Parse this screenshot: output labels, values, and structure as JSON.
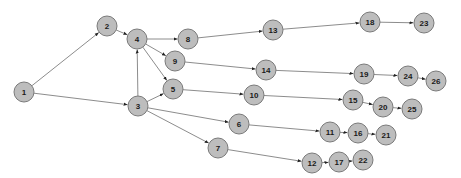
{
  "diagram": {
    "type": "directed-graph",
    "node_fill": "#bdbdbd",
    "node_stroke": "#7a7a7a",
    "edge_color": "#6f6f6f",
    "nodes": [
      {
        "id": "1",
        "label": "1",
        "x": 24,
        "y": 92
      },
      {
        "id": "2",
        "label": "2",
        "x": 107,
        "y": 26
      },
      {
        "id": "3",
        "label": "3",
        "x": 138,
        "y": 106
      },
      {
        "id": "4",
        "label": "4",
        "x": 137,
        "y": 39
      },
      {
        "id": "5",
        "label": "5",
        "x": 173,
        "y": 89
      },
      {
        "id": "6",
        "label": "6",
        "x": 239,
        "y": 124
      },
      {
        "id": "7",
        "label": "7",
        "x": 218,
        "y": 148
      },
      {
        "id": "8",
        "label": "8",
        "x": 188,
        "y": 39
      },
      {
        "id": "9",
        "label": "9",
        "x": 175,
        "y": 61
      },
      {
        "id": "10",
        "label": "10",
        "x": 254,
        "y": 95
      },
      {
        "id": "11",
        "label": "11",
        "x": 330,
        "y": 132
      },
      {
        "id": "12",
        "label": "12",
        "x": 312,
        "y": 163
      },
      {
        "id": "13",
        "label": "13",
        "x": 273,
        "y": 30
      },
      {
        "id": "14",
        "label": "14",
        "x": 266,
        "y": 70
      },
      {
        "id": "15",
        "label": "15",
        "x": 353,
        "y": 100
      },
      {
        "id": "16",
        "label": "16",
        "x": 358,
        "y": 133
      },
      {
        "id": "17",
        "label": "17",
        "x": 339,
        "y": 162
      },
      {
        "id": "18",
        "label": "18",
        "x": 370,
        "y": 22
      },
      {
        "id": "19",
        "label": "19",
        "x": 364,
        "y": 74
      },
      {
        "id": "20",
        "label": "20",
        "x": 383,
        "y": 107
      },
      {
        "id": "21",
        "label": "21",
        "x": 386,
        "y": 135
      },
      {
        "id": "22",
        "label": "22",
        "x": 363,
        "y": 160
      },
      {
        "id": "23",
        "label": "23",
        "x": 424,
        "y": 23
      },
      {
        "id": "24",
        "label": "24",
        "x": 408,
        "y": 76
      },
      {
        "id": "25",
        "label": "25",
        "x": 412,
        "y": 109
      },
      {
        "id": "26",
        "label": "26",
        "x": 436,
        "y": 81
      }
    ],
    "edges": [
      {
        "from": "1",
        "to": "2"
      },
      {
        "from": "1",
        "to": "3"
      },
      {
        "from": "2",
        "to": "4"
      },
      {
        "from": "3",
        "to": "4"
      },
      {
        "from": "4",
        "to": "8"
      },
      {
        "from": "4",
        "to": "9"
      },
      {
        "from": "4",
        "to": "5"
      },
      {
        "from": "3",
        "to": "5"
      },
      {
        "from": "3",
        "to": "6"
      },
      {
        "from": "3",
        "to": "7"
      },
      {
        "from": "8",
        "to": "13"
      },
      {
        "from": "9",
        "to": "14"
      },
      {
        "from": "5",
        "to": "10"
      },
      {
        "from": "6",
        "to": "11"
      },
      {
        "from": "7",
        "to": "12"
      },
      {
        "from": "13",
        "to": "18"
      },
      {
        "from": "14",
        "to": "19"
      },
      {
        "from": "10",
        "to": "15"
      },
      {
        "from": "11",
        "to": "16"
      },
      {
        "from": "12",
        "to": "17"
      },
      {
        "from": "18",
        "to": "23"
      },
      {
        "from": "19",
        "to": "24"
      },
      {
        "from": "15",
        "to": "20"
      },
      {
        "from": "16",
        "to": "21"
      },
      {
        "from": "17",
        "to": "22"
      },
      {
        "from": "24",
        "to": "26"
      },
      {
        "from": "20",
        "to": "25"
      }
    ]
  }
}
